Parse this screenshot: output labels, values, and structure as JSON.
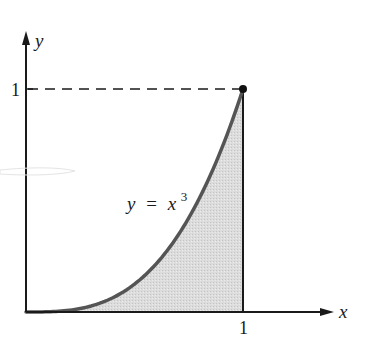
{
  "chart_data": {
    "type": "area",
    "title": "",
    "function_label": "y = x³",
    "function_label_parts": {
      "lhs": "y",
      "eq": "=",
      "base": "x",
      "exponent": "3"
    },
    "xlabel": "x",
    "ylabel": "y",
    "xlim": [
      0,
      1
    ],
    "ylim": [
      0,
      1
    ],
    "x_ticks": [
      {
        "value": 1,
        "label": "1"
      }
    ],
    "y_ticks": [
      {
        "value": 1,
        "label": "1"
      }
    ],
    "x": [
      0,
      0.1,
      0.2,
      0.3,
      0.4,
      0.5,
      0.6,
      0.7,
      0.8,
      0.9,
      1.0
    ],
    "series": [
      {
        "name": "y = x^3",
        "values": [
          0,
          0.001,
          0.008,
          0.027,
          0.064,
          0.125,
          0.216,
          0.343,
          0.512,
          0.729,
          1.0
        ]
      }
    ],
    "shaded_region": "area under y = x^3 from x = 0 to x = 1",
    "endpoint": {
      "x": 1,
      "y": 1
    },
    "reference_lines": [
      {
        "type": "horizontal",
        "value": 1,
        "style": "dashed",
        "from_x": 0,
        "to_x": 1
      },
      {
        "type": "vertical",
        "value": 1,
        "style": "solid",
        "from_y": 0,
        "to_y": 1
      }
    ],
    "grid": false,
    "legend": "none"
  },
  "colors": {
    "curve": "#555555",
    "fill": "#d8d8d8",
    "axis": "#1a1a1a"
  }
}
